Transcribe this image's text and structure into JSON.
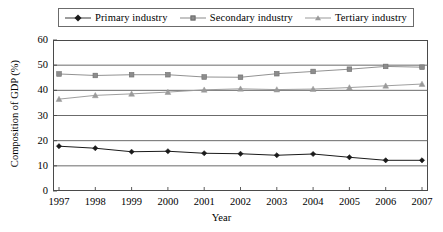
{
  "chart_data": {
    "type": "line",
    "title": "",
    "xlabel": "Year",
    "ylabel": "Composition of GDP (%)",
    "x": [
      1997,
      1998,
      1999,
      2000,
      2001,
      2002,
      2003,
      2004,
      2005,
      2006,
      2007
    ],
    "categories": [
      "1997",
      "1998",
      "1999",
      "2000",
      "2001",
      "2002",
      "2003",
      "2004",
      "2005",
      "2006",
      "2007"
    ],
    "xlim": [
      1997,
      2007
    ],
    "ylim": [
      0,
      60
    ],
    "yticks": [
      0,
      10,
      20,
      30,
      40,
      50,
      60
    ],
    "ytick_labels": [
      "0",
      "10",
      "20",
      "30",
      "40",
      "50",
      "60"
    ],
    "grid": true,
    "grid_axis": "y",
    "legend_position": "top",
    "series": [
      {
        "name": "Primary industry",
        "marker": "diamond",
        "color": "#1a1a1a",
        "values": [
          17.8,
          17.0,
          15.6,
          15.8,
          15.0,
          14.8,
          14.2,
          14.7,
          13.4,
          12.2,
          12.2
        ]
      },
      {
        "name": "Secondary industry",
        "marker": "square",
        "color": "#8c8c8c",
        "values": [
          46.5,
          45.9,
          46.2,
          46.2,
          45.3,
          45.2,
          46.6,
          47.5,
          48.4,
          49.5,
          49.2
        ]
      },
      {
        "name": "Tertiary industry",
        "marker": "triangle",
        "color": "#9a9a9a",
        "values": [
          36.5,
          38.0,
          38.6,
          39.3,
          40.2,
          40.6,
          40.3,
          40.5,
          41.1,
          41.8,
          42.5
        ]
      }
    ]
  },
  "legend": {
    "entries": [
      {
        "label": "Primary industry",
        "marker": "diamond-marker"
      },
      {
        "label": "Secondary industry",
        "marker": "square-marker"
      },
      {
        "label": "Tertiary industry",
        "marker": "triangle-marker"
      }
    ]
  },
  "axes": {
    "x_title": "Year",
    "y_title": "Composition of GDP (%)"
  },
  "colors": {
    "primary": "#1a1a1a",
    "secondary": "#8c8c8c",
    "tertiary": "#9a9a9a",
    "grid": "#5a5a5a",
    "frame": "#4a4a4a",
    "background": "#ffffff"
  }
}
